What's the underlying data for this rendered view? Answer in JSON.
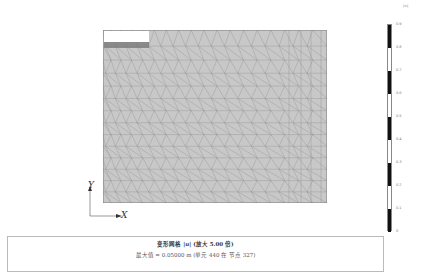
{
  "colorbar": {
    "unit": "[m]",
    "labels": [
      "0.9",
      "0.8",
      "0.7",
      "0.6",
      "0.5",
      "0.4",
      "0.3",
      "0.2",
      "0.1",
      "0"
    ],
    "segments": [
      "#111111",
      "#ffffff",
      "#111111",
      "#ffffff",
      "#111111",
      "#ffffff",
      "#111111",
      "#ffffff",
      "#111111"
    ]
  },
  "axes": {
    "x_label": "X",
    "y_label": "Y"
  },
  "mesh": {
    "fill_color": "#c8c8c8",
    "line_color": "#8a8a8a",
    "cutout_color": "#ffffff",
    "band_color": "#7a7a7a"
  },
  "caption": {
    "title_prefix": "变形网格 ",
    "title_var": "|u|",
    "title_suffix": " (放大 ",
    "scale": "5.00",
    "title_end": " 倍)",
    "max_text": "最大值 = 0.05000 m (单元 440 在 节点 327)"
  }
}
